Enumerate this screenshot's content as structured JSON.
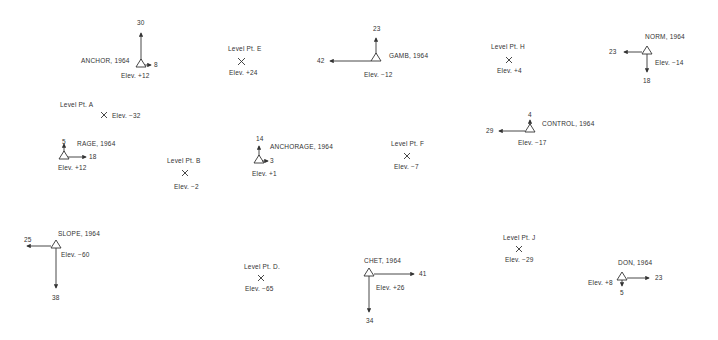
{
  "diagram": {
    "title": "",
    "stations": [
      {
        "id": "anchor",
        "name": "ANCHOR, 1964",
        "elevation": "Elev. +12",
        "arrows": [
          {
            "dir": "up",
            "value": "30"
          },
          {
            "dir": "right",
            "value": "8"
          }
        ]
      },
      {
        "id": "gamb",
        "name": "GAMB, 1964",
        "elevation": "Elev. −12",
        "arrows": [
          {
            "dir": "up",
            "value": "23"
          },
          {
            "dir": "left",
            "value": "42"
          }
        ]
      },
      {
        "id": "norm",
        "name": "NORM, 1964",
        "elevation": "Elev. −14",
        "arrows": [
          {
            "dir": "left",
            "value": "23"
          },
          {
            "dir": "down",
            "value": "18"
          }
        ]
      },
      {
        "id": "rage",
        "name": "RAGE, 1964",
        "elevation": "Elev. +12",
        "arrows": [
          {
            "dir": "up",
            "value": "5"
          },
          {
            "dir": "right",
            "value": "18"
          }
        ]
      },
      {
        "id": "anchorage",
        "name": "ANCHORAGE, 1964",
        "elevation": "Elev. +1",
        "arrows": [
          {
            "dir": "up",
            "value": "14"
          },
          {
            "dir": "right",
            "value": "3"
          }
        ]
      },
      {
        "id": "control",
        "name": "CONTROL, 1964",
        "elevation": "Elev. −17",
        "arrows": [
          {
            "dir": "up",
            "value": "4"
          },
          {
            "dir": "left",
            "value": "29"
          }
        ]
      },
      {
        "id": "slope",
        "name": "SLOPE, 1964",
        "elevation": "Elev. −60",
        "arrows": [
          {
            "dir": "left",
            "value": "25"
          },
          {
            "dir": "down",
            "value": "38"
          }
        ]
      },
      {
        "id": "chet",
        "name": "CHET, 1964",
        "elevation": "Elev. +26",
        "arrows": [
          {
            "dir": "right",
            "value": "41"
          },
          {
            "dir": "down",
            "value": "34"
          }
        ]
      },
      {
        "id": "don",
        "name": "DON, 1964",
        "elevation": "Elev. +8",
        "arrows": [
          {
            "dir": "right",
            "value": "23"
          },
          {
            "dir": "down",
            "value": "5"
          }
        ]
      }
    ],
    "level_points": [
      {
        "id": "a",
        "name": "Level Pt. A",
        "elevation": "Elev. −32"
      },
      {
        "id": "b",
        "name": "Level Pt. B",
        "elevation": "Elev. −2"
      },
      {
        "id": "d",
        "name": "Level Pt. D.",
        "elevation": "Elev. −65"
      },
      {
        "id": "e",
        "name": "Level Pt. E",
        "elevation": "Elev. +24"
      },
      {
        "id": "f",
        "name": "Level Pt. F",
        "elevation": "Elev. −7"
      },
      {
        "id": "h",
        "name": "Level Pt. H",
        "elevation": "Elev. +4"
      },
      {
        "id": "j",
        "name": "Level Pt. J",
        "elevation": "Elev. −29"
      }
    ],
    "symbols": {
      "station": "triangle-icon",
      "level_point": "x-mark-icon"
    }
  }
}
